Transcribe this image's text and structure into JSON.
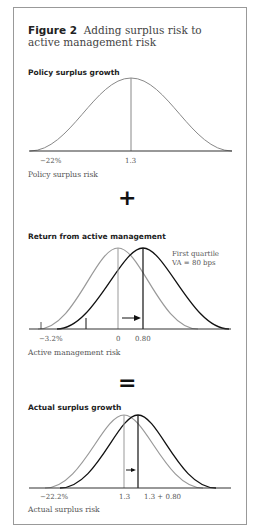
{
  "figure": {
    "number": "Figure 2",
    "title": "Adding surplus risk to active management risk"
  },
  "panels": [
    {
      "heading": "Policy surplus growth",
      "axis_labels": [
        "−22%",
        "1.3"
      ],
      "caption": "Policy surplus risk"
    },
    {
      "heading": "Return from active management",
      "axis_labels": [
        "−3.2%",
        "0",
        "0.80"
      ],
      "annotation": [
        "First quartile",
        "VA = 80 bps"
      ],
      "caption": "Active management risk"
    },
    {
      "heading": "Actual surplus growth",
      "axis_labels": [
        "−22.2%",
        "1.3",
        "1.3 + 0.80"
      ],
      "caption": "Actual surplus risk"
    }
  ],
  "operators": {
    "plus": "+",
    "equals": "="
  }
}
